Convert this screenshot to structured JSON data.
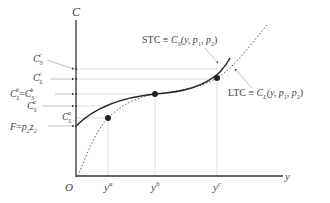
{
  "diagram": {
    "type": "cost-curve-diagram",
    "axes": {
      "y_axis_label": "C",
      "x_axis_label": "y",
      "origin_label": "O"
    },
    "x_ticks": [
      {
        "label": "y",
        "sup": "a"
      },
      {
        "label": "y",
        "sup": "b"
      },
      {
        "label": "y",
        "sup": "c"
      }
    ],
    "c_axis_labels": [
      {
        "id": "cs_c",
        "base": "C",
        "sub": "S",
        "sup": "c"
      },
      {
        "id": "cl_c",
        "base": "C",
        "sub": "L",
        "sup": "c"
      },
      {
        "id": "cl_b_eq_cs_b",
        "left_base": "C",
        "left_sub": "L",
        "left_sup": "b",
        "eq": "=",
        "right_base": "C",
        "right_sub": "S",
        "right_sup": "b"
      },
      {
        "id": "cs_a",
        "base": "C",
        "sub": "S",
        "sup": "a"
      },
      {
        "id": "cl_a",
        "base": "C",
        "sub": "L",
        "sup": "a"
      },
      {
        "id": "fixed",
        "text_F": "F",
        "eq": "=",
        "p": "p",
        "p_sub": "2",
        "z": "z",
        "z_sub": "2"
      }
    ],
    "curves": [
      {
        "id": "stc",
        "name": "STC",
        "equiv": "≡",
        "func": "C",
        "func_sub": "S",
        "args": "(y, p",
        "args_sub1": "1",
        "args_mid": ", p",
        "args_sub2": "2",
        "args_end": ")",
        "style": "solid"
      },
      {
        "id": "ltc",
        "name": "LTC",
        "equiv": "≡",
        "func": "C",
        "func_sub": "L",
        "args": "(y, p",
        "args_sub1": "1",
        "args_mid": ", p",
        "args_sub2": "2",
        "args_end": ")",
        "style": "dotted"
      }
    ],
    "colors": {
      "axis": "#333333",
      "stc": "#2a2a2a",
      "ltc": "#555555",
      "guide": "#cccccc",
      "text": "#444444"
    }
  }
}
